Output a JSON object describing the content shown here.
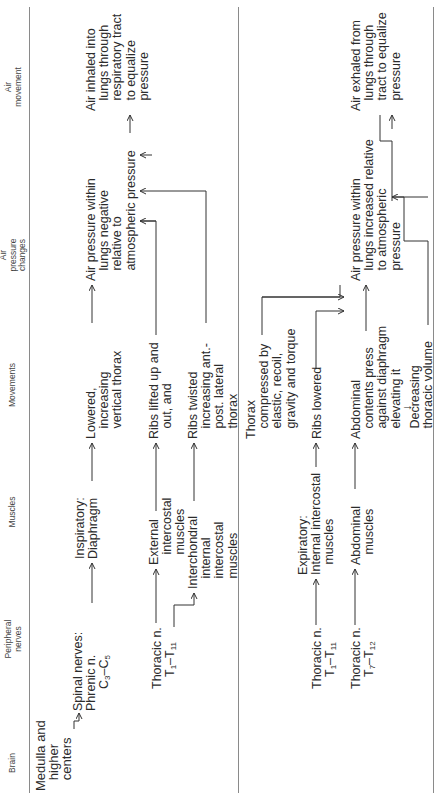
{
  "headers": {
    "brain": "Brain",
    "peripheral_nerves": "Peripheral\nnerves",
    "muscles": "Muscles",
    "movements": "Movements",
    "air_pressure_changes": "Air\npressure\nchanges",
    "air_movement": "Air\nmovement"
  },
  "brain": {
    "label": "Medulla and\n   higher\n   centers"
  },
  "inspiration": {
    "nerves": {
      "spinal": "Spinal nerves:\nPhrenic n.",
      "spinal_range_prefix": "C",
      "spinal_range_a": "3",
      "spinal_range_mid": "–C",
      "spinal_range_b": "5",
      "thoracic": "Thoracic n.",
      "thoracic_range_prefix": "T",
      "thoracic_range_a": "1",
      "thoracic_range_mid": "–T",
      "thoracic_range_b": "11"
    },
    "muscles": {
      "diaphragm": "Inspiratory:\nDiaphragm",
      "external": "External\n   intercostal\n   muscles",
      "interchondral": "Interchondral\n   internal\n   intercostal\n   muscles"
    },
    "movements": {
      "lowered": "Lowered,\n   increasing\n   vertical thorax",
      "ribs_lifted": "Ribs lifted up and\n   out, and",
      "ribs_twisted": "Ribs twisted\n   increasing ant.-\n   post. lateral\n   thorax"
    },
    "pressure": "Air pressure within\n   lungs negative\n   relative to\n   atmospheric pressure",
    "air_movement": "Air inhaled into\n   lungs through\n   respiratory tract\n   to equalize\n   pressure"
  },
  "expiration": {
    "nerves": {
      "thoracic_1": "Thoracic n.",
      "thoracic_1_range_prefix": "T",
      "thoracic_1_range_a": "1",
      "thoracic_1_range_mid": "–T",
      "thoracic_1_range_b": "11",
      "thoracic_2": "Thoracic n.",
      "thoracic_2_range_prefix": "T",
      "thoracic_2_range_a": "7",
      "thoracic_2_range_mid": "–T",
      "thoracic_2_range_b": "12"
    },
    "muscles": {
      "internal": "Expiratory:\nInternal intercostal\n   muscles",
      "abdominal": "Abdominal\n   muscles"
    },
    "movements": {
      "thorax_compressed": "Thorax\n   compressed by\n   elastic, recoil,\n   gravity and torque",
      "ribs_lowered": "Ribs lowered",
      "abdominal_contents": "Abdominal\n   contents press\n   against diaphragm\n   elevating it",
      "down_arrow": "↓",
      "decreasing": "   Decreasing\n   thoracic volume"
    },
    "pressure": "Air pressure within\n   lungs increased relative\n   to atmospheric\n   pressure",
    "air_movement": "Air exhaled from\n   lungs through\n   tract to equalize\n   pressure"
  }
}
